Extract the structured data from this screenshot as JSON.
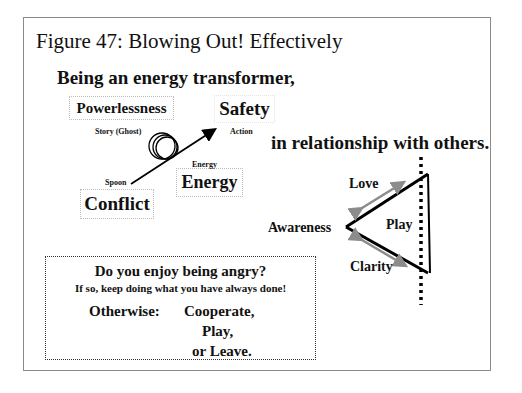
{
  "figure": {
    "title": "Figure 47: Blowing Out! Effectively",
    "heading_top": "Being an energy transformer,",
    "heading_right": "in relationship with others."
  },
  "transformer": {
    "boxes": {
      "powerlessness": "Powerlessness",
      "safety": "Safety",
      "conflict": "Conflict",
      "energy": "Energy"
    },
    "labels": {
      "story": "Story (Ghost)",
      "action": "Action",
      "energy_small": "Energy",
      "spoon": "Spoon"
    }
  },
  "triangle": {
    "vertices": {
      "left": "Awareness",
      "top": "Love",
      "bottom": "Clarity"
    },
    "center": "Play",
    "colors": {
      "edge": "#000000",
      "arrow": "#8c8c8c"
    }
  },
  "note": {
    "question": "Do you enjoy being angry?",
    "subline": "If so, keep doing what you have always done!",
    "otherwise_label": "Otherwise:",
    "options": [
      "Cooperate,",
      "Play,",
      "or Leave."
    ]
  }
}
